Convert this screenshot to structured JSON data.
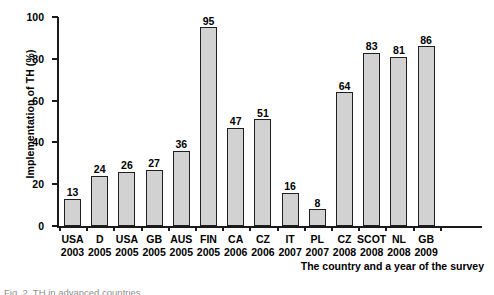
{
  "chart_data": {
    "type": "bar",
    "title": "",
    "xlabel": "The country and a year of the survey",
    "ylabel": "Implementation of TH (%)",
    "ylim": [
      0,
      100
    ],
    "yticks": [
      0,
      20,
      40,
      60,
      80,
      100
    ],
    "grid": false,
    "legend": null,
    "categories": [
      "USA 2003",
      "D 2005",
      "USA 2005",
      "GB 2005",
      "AUS 2005",
      "FIN 2005",
      "CA 2006",
      "CZ 2006",
      "IT 2007",
      "PL 2007",
      "CZ 2008",
      "SCOT 2008",
      "NL 2008",
      "GB 2009"
    ],
    "countries": [
      "USA",
      "D",
      "USA",
      "GB",
      "AUS",
      "FIN",
      "CA",
      "CZ",
      "IT",
      "PL",
      "CZ",
      "SCOT",
      "NL",
      "GB"
    ],
    "years": [
      "2003",
      "2005",
      "2005",
      "2005",
      "2005",
      "2005",
      "2006",
      "2006",
      "2007",
      "2007",
      "2008",
      "2008",
      "2008",
      "2009"
    ],
    "values": [
      13,
      24,
      26,
      27,
      36,
      95,
      47,
      51,
      16,
      8,
      64,
      83,
      81,
      86
    ],
    "bar_fill_color": "#d2d2d2",
    "bar_edge_color": "#1f1f1f",
    "axis_color": "#1a1a1a"
  },
  "caption": {
    "text": "Fig. 2. TH in advanced countries"
  }
}
